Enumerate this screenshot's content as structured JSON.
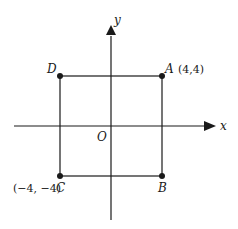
{
  "diagram": {
    "axes": {
      "x_label": "x",
      "y_label": "y",
      "origin_label": "O"
    },
    "points": [
      {
        "name": "A",
        "coord_label": "(4,4)"
      },
      {
        "name": "B",
        "coord_label": ""
      },
      {
        "name": "C",
        "coord_label": "(−4, −4)"
      },
      {
        "name": "D",
        "coord_label": ""
      }
    ],
    "colors": {
      "line": "#1a1a1a",
      "background": "#ffffff"
    }
  }
}
